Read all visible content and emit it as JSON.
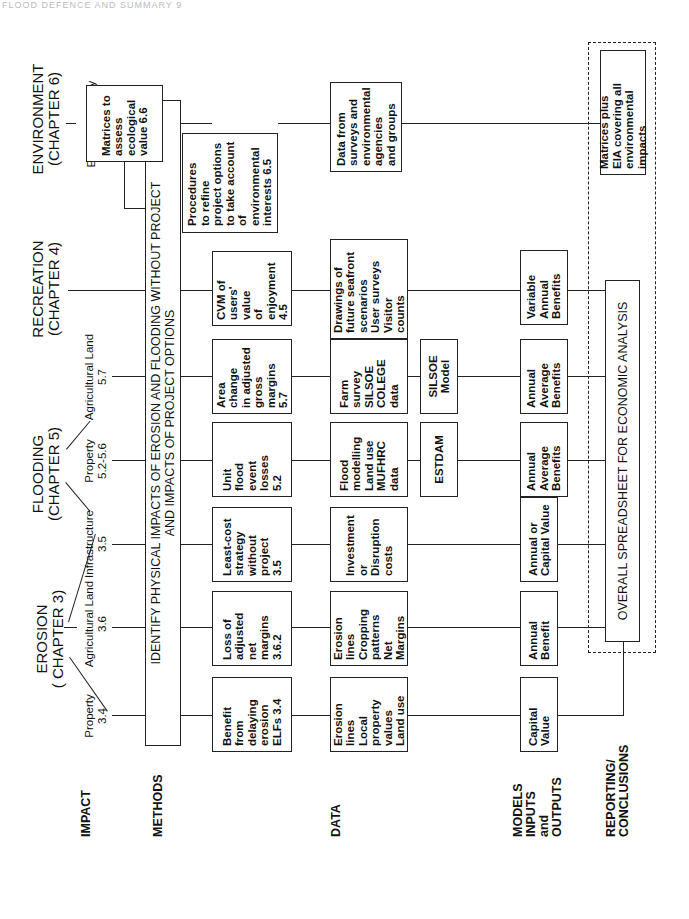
{
  "page_header": "FLOOD DEFENCE AND SUMMARY  9",
  "row_labels": {
    "impact": "IMPACT",
    "methods": "METHODS",
    "data": "DATA",
    "models": "MODELS\nINPUTS\nand\nOUTPUTS",
    "reporting": "REPORTING/\nCONCLUSIONS"
  },
  "chapters": {
    "erosion": "EROSION\n( CHAPTER 3)",
    "flooding": "FLOODING\n(CHAPTER 5)",
    "recreation": "RECREATION\n(CHAPTER 4)",
    "environment": "ENVIRONMENT\n(CHAPTER 6)"
  },
  "impacts": [
    {
      "label": "Property\n3.4"
    },
    {
      "label": "Agricultural Land\n3.6"
    },
    {
      "label": "Infrastructure\n3.5"
    },
    {
      "label": "Property\n5.2-5.6"
    },
    {
      "label": "Agricultural Land\n5.7"
    },
    {
      "label": ""
    },
    {
      "label": "Ecology, geology\narchaeology"
    }
  ],
  "methods_bar": "IDENTIFY PHYSICAL IMPACTS OF EROSION AND FLOODING WITHOUT PROJECT\nAND IMPACTS OF PROJECT OPTIONS",
  "methods": [
    "Benefit\nfrom\ndelaying\nerosion\nELFs  3.4",
    "Loss of\nadjusted\nnet\nmargins\n3.6.2",
    "Least-cost\nstrategy\nwithout\nproject\n3.5",
    "Unit\nflood\nevent\nlosses\n5.2",
    "Area\nchange\nin adjusted\ngross\nmargins\n5.7",
    "CVM of\nusers'\nvalue\nof\nenjoyment\n4.5",
    "Matrices to\nassess\necological\nvalue  6.6",
    "Procedures\nto refine\nproject options\nto take account\nof environmental\ninterests  6.5"
  ],
  "data": [
    "Erosion\nlines\nLocal\nproperty\nvalues\nLand use",
    "Erosion\nlines\nCropping\npatterns\nNet Margins",
    "Investment\nor\nDisruption\ncosts",
    "Flood\nmodelling\nLand use\nMUFHRC\ndata",
    "Farm\nsurvey\nSILSOE\nCOLEGE\ndata",
    "Drawings of\nfuture seafront\nscenarios\nUser surveys\nVisitor\ncounts",
    "Data from\nsurveys and\nenvironmental\nagencies\nand groups"
  ],
  "models": [
    "ESTDAM",
    "SILSOE\nModel"
  ],
  "outputs": [
    "Capital\nValue",
    "Annual\nBenefit",
    "Annual or\nCapital Value",
    "Annual\nAverage\nBenefits",
    "Annual\nAverage\nBenefits",
    "Variable\nAnnual\nBenefits"
  ],
  "reporting": {
    "spreadsheet": "OVERALL SPREADSHEET FOR ECONOMIC ANALYSIS",
    "eia": "Matrices plus\nEIA covering all\nenvironmental impacts"
  }
}
